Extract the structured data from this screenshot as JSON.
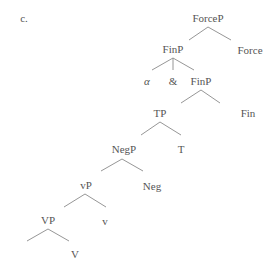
{
  "example_label": "c.",
  "tree": {
    "nodes": {
      "forcep": "ForceP",
      "finp_upper": "FinP",
      "force": "Force",
      "alpha": "α",
      "ampersand": "&",
      "finp_lower": "FinP",
      "tp": "TP",
      "fin": "Fin",
      "negp": "NegP",
      "t": "T",
      "little_vp": "vP",
      "neg": "Neg",
      "vp": "VP",
      "little_v": "v",
      "v": "V"
    },
    "edges": [
      [
        "ForceP",
        "FinP"
      ],
      [
        "ForceP",
        "Force"
      ],
      [
        "FinP",
        "α"
      ],
      [
        "FinP",
        "&"
      ],
      [
        "FinP",
        "FinP"
      ],
      [
        "FinP",
        "TP"
      ],
      [
        "FinP",
        "Fin"
      ],
      [
        "TP",
        "NegP"
      ],
      [
        "TP",
        "T"
      ],
      [
        "NegP",
        "vP"
      ],
      [
        "NegP",
        "Neg"
      ],
      [
        "vP",
        "VP"
      ],
      [
        "vP",
        "v"
      ],
      [
        "VP",
        "(empty)"
      ],
      [
        "VP",
        "V"
      ]
    ]
  }
}
